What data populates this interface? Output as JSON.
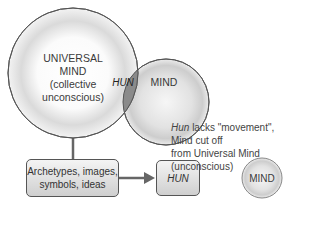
{
  "diagram": {
    "universal_mind": {
      "line1": "UNIVERSAL",
      "line2": "MIND",
      "line3": "(collective",
      "line4": "unconscious)"
    },
    "overlap_label": "HUN",
    "mind_label": "MIND",
    "archetypes_box": {
      "line1": "Archetypes, images,",
      "line2": "symbols, ideas"
    },
    "hun_box_label": "HUN",
    "caption": {
      "italic": "Hun",
      "rest_line1": " lacks \"movement\", Mind cut off",
      "line2": "from Universal Mind (unconscious)"
    },
    "isolated_mind_label": "MIND",
    "colors": {
      "overlap_fill": "#8a8a8a",
      "stroke": "#555555",
      "box_fill": "#dcdcdc"
    }
  }
}
